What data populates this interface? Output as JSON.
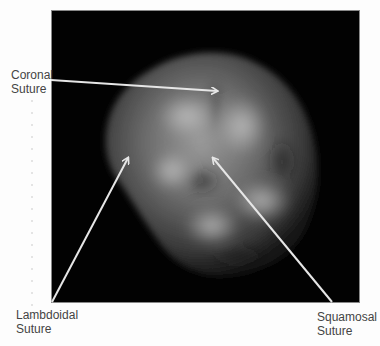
{
  "figure": {
    "background_color": "#020202",
    "arrow_color": "#e6e6e6",
    "labels": {
      "coronal": {
        "line1": "Coronal",
        "line2": "Suture"
      },
      "lambdoidal": {
        "line1": "Lambdoidal",
        "line2": "Suture"
      },
      "squamosal": {
        "line1": "Squamosal",
        "line2": "Suture"
      }
    }
  }
}
